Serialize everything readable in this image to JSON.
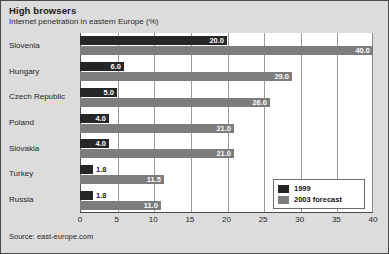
{
  "chart_data": {
    "type": "bar",
    "orientation": "horizontal",
    "title": "High browsers",
    "subtitle": "Internet penetration in eastern Europe (%)",
    "xlabel": "",
    "ylabel": "",
    "xlim": [
      0,
      40
    ],
    "xticks": [
      0,
      5,
      10,
      15,
      20,
      25,
      30,
      35,
      40
    ],
    "xtick_labels": [
      "0",
      "5",
      "10",
      "15",
      "20",
      "25",
      "30",
      "35",
      "40"
    ],
    "grid": true,
    "grid_axis": "x",
    "legend_position": "bottom-right",
    "categories": [
      "Slovenia",
      "Hungary",
      "Czech Republic",
      "Poland",
      "Slovakia",
      "Turkey",
      "Russia"
    ],
    "series": [
      {
        "name": "1999",
        "color": "#262626",
        "values": [
          20.0,
          6.0,
          5.0,
          4.0,
          4.0,
          1.8,
          1.8
        ],
        "labels": [
          "20.0",
          "6.0",
          "5.0",
          "4.0",
          "4.0",
          "1.8",
          "1.8"
        ]
      },
      {
        "name": "2003 forecast",
        "color": "#7d7d7d",
        "values": [
          40.0,
          29.0,
          26.0,
          21.0,
          21.0,
          11.5,
          11.0
        ],
        "labels": [
          "40.0",
          "29.0",
          "26.0",
          "21.0",
          "21.0",
          "11.5",
          "11.0"
        ]
      }
    ],
    "source": "Source: east-europe.com"
  },
  "legend": {
    "items": [
      {
        "label": "1999"
      },
      {
        "label": "2003 forecast"
      }
    ]
  }
}
